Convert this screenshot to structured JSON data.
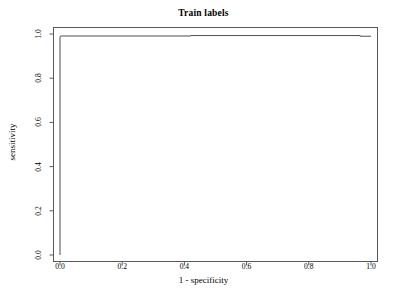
{
  "chart_data": {
    "type": "line",
    "title": "Train labels",
    "xlabel": "1 - specificity",
    "ylabel": "sensitivity",
    "xlim": [
      0,
      1
    ],
    "ylim": [
      0,
      1
    ],
    "grid": false,
    "legend": "none",
    "x_ticks": [
      0.0,
      0.2,
      0.4,
      0.6,
      0.8,
      1.0
    ],
    "y_ticks": [
      0.0,
      0.2,
      0.4,
      0.6,
      0.8,
      1.0
    ],
    "x_tick_labels": [
      "0.0",
      "0.2",
      "0.4",
      "0.6",
      "0.8",
      "1.0"
    ],
    "y_tick_labels": [
      "0.0",
      "0.2",
      "0.4",
      "0.6",
      "0.8",
      "1.0"
    ],
    "series": [
      {
        "name": "ROC curve",
        "color": "#4d4d4d",
        "x": [
          0.0,
          0.0,
          0.003,
          0.42,
          0.42,
          0.965,
          0.965,
          1.0
        ],
        "y": [
          0.0,
          0.988,
          0.991,
          0.991,
          0.993,
          0.993,
          0.99,
          0.99
        ]
      }
    ]
  },
  "axes": {
    "box_color": "#595959",
    "tick_color": "#595959"
  }
}
